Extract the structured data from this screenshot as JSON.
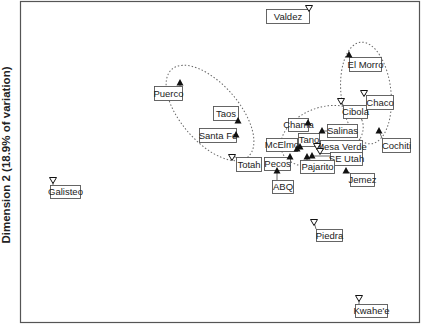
{
  "chart_data": {
    "type": "scatter",
    "title": "",
    "xlabel": "",
    "ylabel": "Dimension 2 (18.9% of variation)",
    "grid": false,
    "legend": null,
    "marker_legend": {
      "filled_triangle_up": "filled up-triangle marker",
      "open_triangle_down": "open down-triangle marker"
    },
    "plot_area_px": {
      "left": 20,
      "top": 1,
      "right": 420,
      "bottom": 323
    },
    "points": [
      {
        "label": "Valdez",
        "marker": "open_down",
        "px": [
          309,
          8
        ],
        "box": [
          266,
          9,
          43,
          14
        ]
      },
      {
        "label": "El Morro",
        "marker": "filled_up",
        "px": [
          349,
          55
        ],
        "box": [
          349,
          57,
          32,
          14
        ]
      },
      {
        "label": "Puerco",
        "marker": "filled_up",
        "px": [
          180,
          83
        ],
        "box": [
          154,
          86,
          28,
          14
        ]
      },
      {
        "label": "Taos",
        "marker": "filled_up",
        "px": [
          238,
          121
        ],
        "box": [
          213,
          106,
          25,
          14
        ]
      },
      {
        "label": "Santa Fe",
        "marker": "filled_up",
        "px": [
          236,
          135
        ],
        "box": [
          199,
          128,
          37,
          14
        ]
      },
      {
        "label": "Totah",
        "marker": "open_down",
        "px": [
          232,
          157
        ],
        "box": [
          236,
          157,
          25,
          14
        ]
      },
      {
        "label": "Cibola",
        "marker": "open_down",
        "px": [
          341,
          101
        ],
        "box": [
          343,
          105,
          24,
          13
        ]
      },
      {
        "label": "Chaco",
        "marker": "open_down",
        "px": [
          364,
          93
        ],
        "box": [
          366,
          95,
          27,
          14
        ]
      },
      {
        "label": "Chama",
        "marker": "filled_up",
        "px": [
          308,
          123
        ],
        "box": [
          288,
          118,
          20,
          13
        ]
      },
      {
        "label": "Salinas",
        "marker": "filled_up",
        "px": [
          322,
          131
        ],
        "box": [
          327,
          124,
          30,
          13
        ]
      },
      {
        "label": "Cochiti",
        "marker": "filled_up",
        "px": [
          379,
          131
        ],
        "box": [
          382,
          138,
          28,
          14
        ]
      },
      {
        "label": "Tano",
        "marker": "filled_up",
        "px": [
          300,
          147
        ],
        "box": [
          298,
          133,
          21,
          13
        ]
      },
      {
        "label": "McElmo",
        "marker": "filled_up",
        "px": [
          297,
          149
        ],
        "box": [
          266,
          138,
          31,
          13
        ]
      },
      {
        "label": "Mesa Verde",
        "marker": "open_down",
        "px": [
          317,
          146
        ],
        "box": [
          320,
          140,
          42,
          13
        ]
      },
      {
        "label": "SE Utah",
        "marker": "filled_up",
        "px": [
          312,
          156
        ],
        "box": [
          330,
          152,
          32,
          13
        ]
      },
      {
        "label": "SE Utah (alt)",
        "marker": "open_down",
        "px": [
          320,
          151
        ],
        "box": null
      },
      {
        "label": "Pecos",
        "marker": "filled_up",
        "px": [
          290,
          157
        ],
        "box": [
          264,
          157,
          26,
          13
        ]
      },
      {
        "label": "Pajarito",
        "marker": "filled_up",
        "px": [
          307,
          157
        ],
        "box": [
          300,
          160,
          34,
          13
        ]
      },
      {
        "label": "Jemez",
        "marker": "filled_up",
        "px": [
          346,
          171
        ],
        "box": [
          350,
          173,
          24,
          13
        ]
      },
      {
        "label": "ABQ",
        "marker": "filled_up",
        "px": [
          277,
          171
        ],
        "box": [
          272,
          180,
          21,
          13
        ]
      },
      {
        "label": "Galisteo",
        "marker": "open_down",
        "px": [
          53,
          180
        ],
        "box": [
          50,
          185,
          30,
          13
        ]
      },
      {
        "label": "Piedra",
        "marker": "open_down",
        "px": [
          314,
          222
        ],
        "box": [
          316,
          229,
          26,
          12
        ]
      },
      {
        "label": "Kwahe'e",
        "marker": "open_down",
        "px": [
          359,
          298
        ],
        "box": [
          355,
          304,
          32,
          13
        ]
      }
    ],
    "ellipses": [
      {
        "name": "northern-rio-grande-cluster",
        "cx": 210,
        "cy": 113,
        "rx": 58,
        "ry": 29,
        "rotate": 49
      },
      {
        "name": "central-cluster",
        "cx": 322,
        "cy": 136,
        "rx": 43,
        "ry": 28,
        "rotate": -22
      },
      {
        "name": "chaco-cluster",
        "cx": 366,
        "cy": 93,
        "rx": 25,
        "ry": 51,
        "rotate": -6
      }
    ]
  },
  "colors": {
    "marker": "#111111",
    "label_border": "#555555",
    "ellipse": "#666666",
    "frame": "#555555",
    "text": "#222222"
  }
}
